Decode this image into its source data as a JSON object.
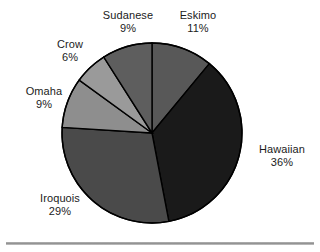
{
  "chart_data": {
    "type": "pie",
    "title": "",
    "subtitle": "",
    "xlabel": "",
    "ylabel": "",
    "legend_position": "none",
    "grid": false,
    "labels_show_percent": true,
    "start_angle_deg": 0,
    "direction": "clockwise",
    "categories": [
      "Eskimo",
      "Hawaiian",
      "Iroquois",
      "Omaha",
      "Crow",
      "Sudanese"
    ],
    "values": [
      11,
      36,
      29,
      9,
      6,
      9
    ],
    "units": "%",
    "slices": [
      {
        "name": "Eskimo",
        "value": 11,
        "percent_label": "11%",
        "color": "#585858",
        "start_deg": 0,
        "end_deg": 39.6,
        "label_pos": "top-right"
      },
      {
        "name": "Hawaiian",
        "value": 36,
        "percent_label": "36%",
        "color": "#1a1a1a",
        "start_deg": 39.6,
        "end_deg": 169.2,
        "label_pos": "right"
      },
      {
        "name": "Iroquois",
        "value": 29,
        "percent_label": "29%",
        "color": "#4a4a4a",
        "start_deg": 169.2,
        "end_deg": 273.6,
        "label_pos": "bottom-left"
      },
      {
        "name": "Omaha",
        "value": 9,
        "percent_label": "9%",
        "color": "#8e8e8e",
        "start_deg": 273.6,
        "end_deg": 306.0,
        "label_pos": "left"
      },
      {
        "name": "Crow",
        "value": 6,
        "percent_label": "6%",
        "color": "#9a9a9a",
        "start_deg": 306.0,
        "end_deg": 327.6,
        "label_pos": "upper-left"
      },
      {
        "name": "Sudanese",
        "value": 9,
        "percent_label": "9%",
        "color": "#5e5e5e",
        "start_deg": 327.6,
        "end_deg": 360.0,
        "label_pos": "top"
      }
    ],
    "geometry": {
      "center_x": 152,
      "center_y": 133,
      "radius": 90
    },
    "style": {
      "slice_border_color": "#000000",
      "slice_border_width": 1.4,
      "background": "#ffffff"
    }
  },
  "decorations": {
    "bottom_rule_color": "#9a9a9a"
  }
}
